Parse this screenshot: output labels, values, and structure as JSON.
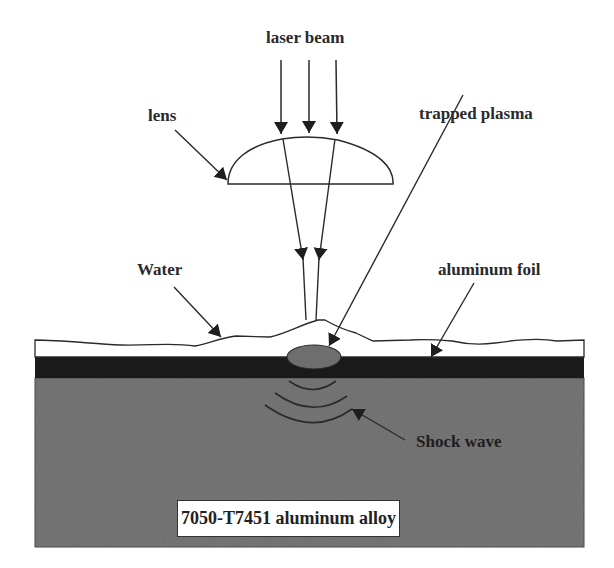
{
  "figure": {
    "type": "schematic"
  },
  "labels": {
    "laser_beam": "laser beam",
    "lens": "lens",
    "trapped_plasma": "trapped plasma",
    "water": "Water",
    "aluminum_foil": "aluminum foil",
    "shock_wave": "Shock wave",
    "alloy": "7050-T7451 aluminum alloy"
  },
  "colors": {
    "water": "#ffffff",
    "foil": "#1a1a1a",
    "alloy": "#6b6b6b",
    "plasma": "#6e6e6e",
    "lines": "#2a2a2a"
  }
}
